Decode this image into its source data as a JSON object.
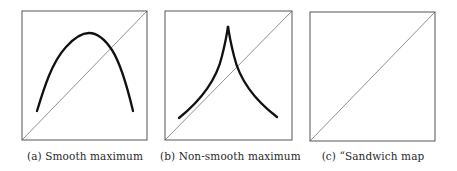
{
  "figure": {
    "panels": [
      {
        "id": "a",
        "caption": "(a) Smooth maximum",
        "box": {
          "x": 22,
          "y": 11,
          "w": 125,
          "h": 129
        },
        "curves": [
          {
            "name": "smooth-maximum-curve",
            "path": "M37,111 C45,88 52,64 66,48 C76,37 84,33 89,33 C96,33 104,38 112,50 C121,64 128,90 133,111"
          }
        ]
      },
      {
        "id": "b",
        "caption": "(b) Non-smooth maximum",
        "box": {
          "x": 165,
          "y": 11,
          "w": 127,
          "h": 129
        },
        "curves": [
          {
            "name": "non-smooth-maximum-curve",
            "path": "M179,118 C200,100 218,82 224,52 C226,42 227,33 228,26 C229,33 230,42 232,52 C238,82 256,100 277,117"
          }
        ]
      },
      {
        "id": "c",
        "caption": "(c) “Sandwich map",
        "box": {
          "x": 310,
          "y": 12,
          "w": 125,
          "h": 129
        },
        "curves": [
          {
            "name": "sandwich-upper-branch-curve",
            "path": "M339,26 C337,52 330,72 314,93 C300,107 296,111 323,118"
          },
          {
            "name": "sandwich-lower-branch-curve",
            "path": "M419,37 C398,49 382,64 374,84 C368,100 367,110 366,126"
          }
        ]
      }
    ],
    "colors": {
      "frame": "#555555",
      "diagonal": "#444444",
      "curve": "#111111",
      "caption": "#2a2a2a"
    }
  }
}
